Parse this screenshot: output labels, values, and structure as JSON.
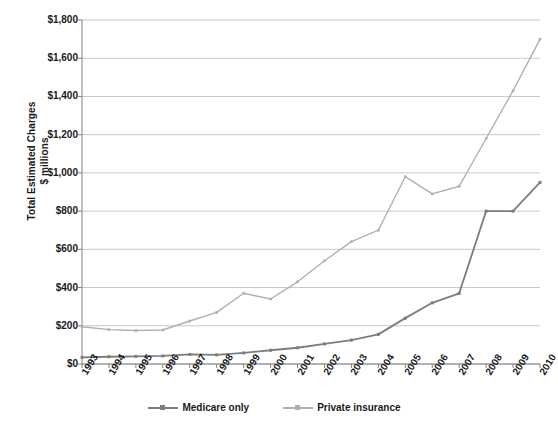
{
  "chart_data": {
    "type": "line",
    "title": "",
    "xlabel": "",
    "ylabel": "Total Estimated Charges $ millions",
    "ylabel_line1": "Total Estimated Charges",
    "ylabel_line2": "$ millions",
    "categories": [
      "1993",
      "1994",
      "1995",
      "1996",
      "1997",
      "1998",
      "1999",
      "2000",
      "2001",
      "2002",
      "2003",
      "2004",
      "2005",
      "2006",
      "2007",
      "2008",
      "2009",
      "2010"
    ],
    "ylim": [
      0,
      1800
    ],
    "ytick_values": [
      0,
      200,
      400,
      600,
      800,
      1000,
      1200,
      1400,
      1600,
      1800
    ],
    "ytick_labels": [
      "$0",
      "$200",
      "$400",
      "$600",
      "$800",
      "$1,000",
      "$1,200",
      "$1,400",
      "$1,600",
      "$1,800"
    ],
    "grid": true,
    "legend_position": "bottom",
    "series": [
      {
        "name": "Medicare only",
        "color": "#7d7d7d",
        "values": [
          35,
          38,
          40,
          42,
          50,
          48,
          58,
          72,
          85,
          105,
          125,
          155,
          240,
          320,
          370,
          800,
          800,
          950
        ]
      },
      {
        "name": "Private insurance",
        "color": "#b0b0b0",
        "values": [
          195,
          180,
          175,
          178,
          225,
          270,
          370,
          340,
          430,
          540,
          640,
          700,
          980,
          890,
          930,
          1180,
          1430,
          1700
        ]
      }
    ]
  },
  "legend": {
    "entries": [
      {
        "label": "Medicare only"
      },
      {
        "label": "Private insurance"
      }
    ]
  }
}
